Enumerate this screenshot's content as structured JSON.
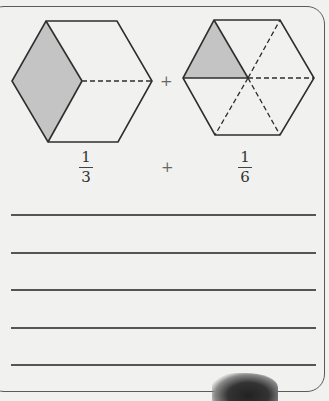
{
  "figure_left": {
    "shape": "hexagon",
    "divisions": 3,
    "shaded_parts": 1,
    "shade_color": "#c4c4c4"
  },
  "figure_right": {
    "shape": "hexagon",
    "divisions": 6,
    "shaded_parts": 1,
    "shade_color": "#c4c4c4"
  },
  "figures_operator": "+",
  "expression": {
    "left": {
      "numerator": "1",
      "denominator": "3"
    },
    "operator": "+",
    "right": {
      "numerator": "1",
      "denominator": "6"
    }
  },
  "answer_lines": 5,
  "colors": {
    "paper": "#f1f1ef",
    "ink": "#333333"
  }
}
